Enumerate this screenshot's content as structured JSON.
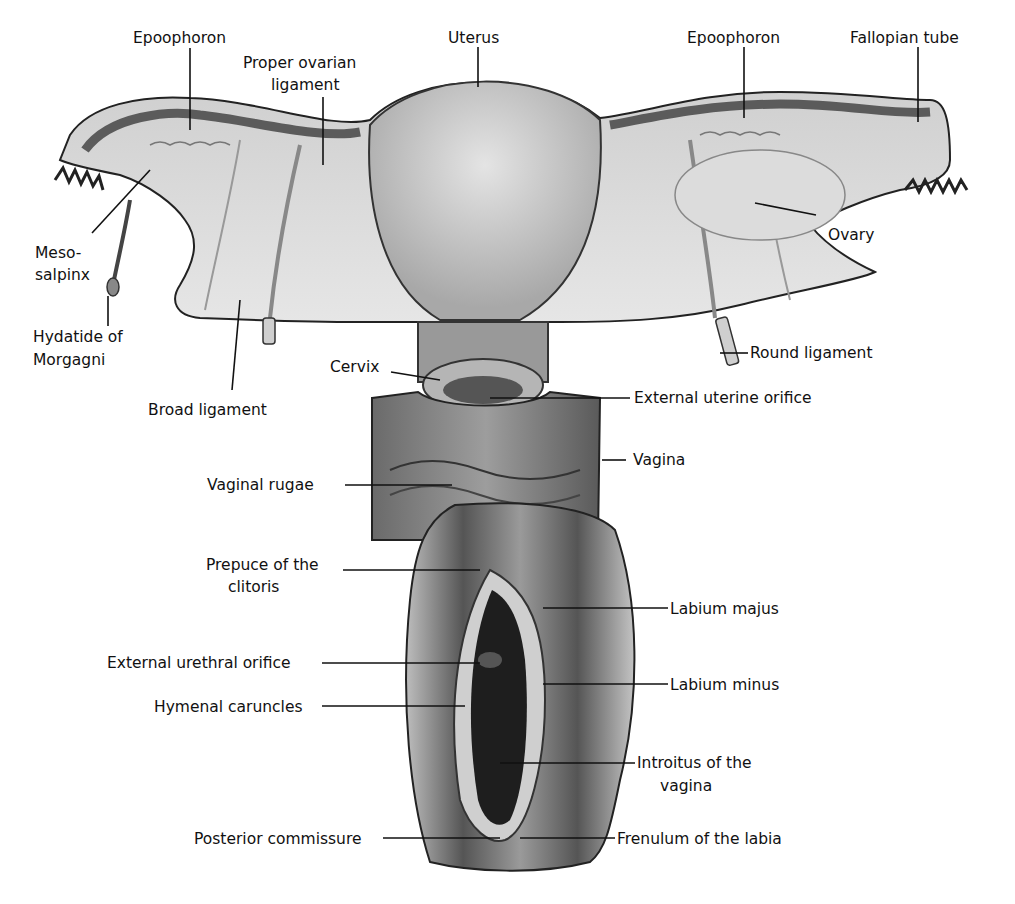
{
  "figure": {
    "type": "anatomical-illustration",
    "style": "grayscale halftone drawing",
    "colors": {
      "background": "#ffffff",
      "ink": "#111111",
      "tissue_light": "#d9d9d9",
      "tissue_mid": "#9a9a9a",
      "tissue_dark": "#3a3a3a"
    }
  },
  "labels": {
    "epoophoron_left": "Epoophoron",
    "proper_ovarian_ligament_1": "Proper ovarian",
    "proper_ovarian_ligament_2": "ligament",
    "uterus": "Uterus",
    "epoophoron_right": "Epoophoron",
    "fallopian_tube": "Fallopian tube",
    "ovary": "Ovary",
    "mesosalpinx_1": "Meso-",
    "mesosalpinx_2": "salpinx",
    "hydatide_1": "Hydatide of",
    "hydatide_2": "Morgagni",
    "broad_ligament": "Broad ligament",
    "cervix": "Cervix",
    "round_ligament": "Round ligament",
    "external_uterine_orifice": "External uterine orifice",
    "vagina": "Vagina",
    "vaginal_rugae": "Vaginal rugae",
    "prepuce_1": "Prepuce of the",
    "prepuce_2": "clitoris",
    "labium_majus": "Labium majus",
    "external_urethral_orifice": "External urethral orifice",
    "labium_minus": "Labium minus",
    "hymenal_caruncles": "Hymenal caruncles",
    "introitus_1": "Introitus of the",
    "introitus_2": "vagina",
    "posterior_commissure": "Posterior commissure",
    "frenulum": "Frenulum of the labia"
  }
}
